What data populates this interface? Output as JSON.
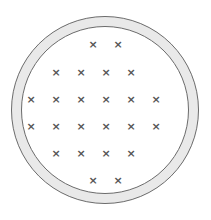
{
  "figure": {
    "canvas": {
      "width": 211,
      "height": 220,
      "background": "#ffffff"
    },
    "annulus": {
      "name": "circular-ring",
      "center_x": 105,
      "center_y": 110,
      "outer_radius": 94,
      "inner_radius": 84,
      "band_fill": "#e9e9e9",
      "band_stroke": "#6b6b6b",
      "band_stroke_width": 1,
      "inner_fill": "#ffffff"
    },
    "marks": {
      "glyph": "×",
      "color": "#555555",
      "font_size": 11,
      "count": 24,
      "column_positions": [
        31,
        56,
        81,
        106,
        131,
        156
      ],
      "row_positions": [
        44,
        72,
        99,
        126,
        153,
        180
      ],
      "rows": [
        {
          "row": 1,
          "y": 44,
          "count": 2,
          "x": [
            93,
            118
          ]
        },
        {
          "row": 2,
          "y": 72,
          "count": 4,
          "x": [
            56,
            81,
            106,
            131
          ]
        },
        {
          "row": 3,
          "y": 99,
          "count": 6,
          "x": [
            31,
            56,
            81,
            106,
            131,
            156
          ]
        },
        {
          "row": 4,
          "y": 126,
          "count": 6,
          "x": [
            31,
            56,
            81,
            106,
            131,
            156
          ]
        },
        {
          "row": 5,
          "y": 153,
          "count": 4,
          "x": [
            56,
            81,
            106,
            131
          ]
        },
        {
          "row": 6,
          "y": 180,
          "count": 2,
          "x": [
            93,
            118
          ]
        }
      ]
    }
  }
}
